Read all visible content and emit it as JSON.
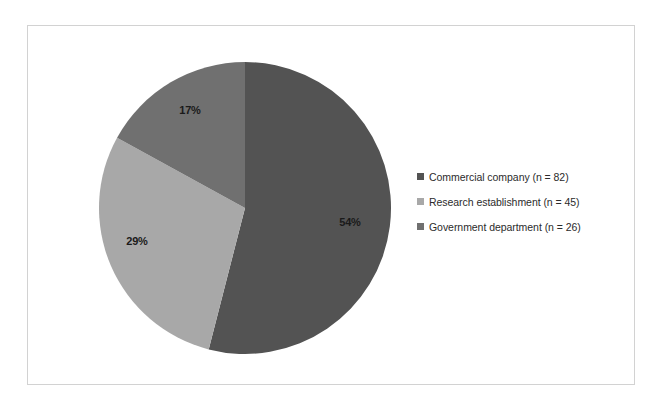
{
  "figure": {
    "background_color": "#ffffff",
    "frame_color": "#d2d2d2"
  },
  "chart_data": {
    "type": "pie",
    "title": "",
    "subtitle": "",
    "xlabel": "",
    "ylabel": "",
    "grid": false,
    "legend_position": "right",
    "start_angle_deg": 0,
    "direction": "clockwise",
    "categories": [
      "Commercial company",
      "Research establishment",
      "Government department"
    ],
    "values": [
      54,
      29,
      17
    ],
    "counts": [
      82,
      45,
      26
    ],
    "value_unit": "percent",
    "total_count": 153,
    "data_labels": [
      "54%",
      "29%",
      "17%"
    ],
    "legend_labels": [
      "Commercial company (n = 82)",
      "Research establishment (n = 45)",
      "Government department (n = 26)"
    ],
    "colors": [
      "#535353",
      "#a8a8a8",
      "#707070"
    ],
    "slices": [
      {
        "name": "Commercial company",
        "label": "54%",
        "value": 54,
        "count": 82,
        "color": "#535353",
        "legend": "Commercial company (n = 82)",
        "label_x": 350,
        "label_y": 222
      },
      {
        "name": "Research establishment",
        "label": "29%",
        "value": 29,
        "count": 45,
        "color": "#a8a8a8",
        "legend": "Research establishment (n = 45)",
        "label_x": 137,
        "label_y": 241
      },
      {
        "name": "Government department",
        "label": "17%",
        "value": 17,
        "count": 26,
        "color": "#707070",
        "legend": "Government department (n = 26)",
        "label_x": 190,
        "label_y": 110
      }
    ],
    "geometry": {
      "center_x": 245,
      "center_y": 208,
      "radius": 146
    }
  }
}
